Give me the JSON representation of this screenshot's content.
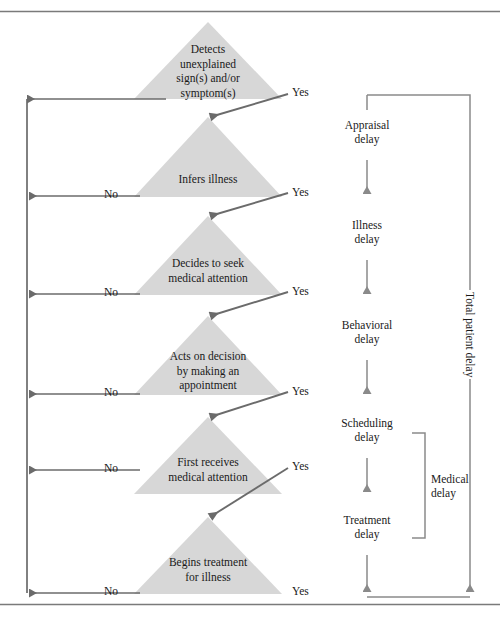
{
  "figure": {
    "colors": {
      "triangle_fill": "#d7d7d7",
      "arrow": "#6b6b6b",
      "rule": "#7a7a7a",
      "text": "#1a1a1a"
    },
    "rules": {
      "top": "horizontal-rule-top",
      "bottom": "horizontal-rule-bottom"
    }
  },
  "stages": [
    {
      "id": "detects",
      "label": "Detects\nunexplained\nsign(s) and/or\nsymptom(s)",
      "yes_label": "Yes",
      "no_label": ""
    },
    {
      "id": "infers",
      "label": "Infers illness",
      "yes_label": "Yes",
      "no_label": "No"
    },
    {
      "id": "decides",
      "label": "Decides to seek\nmedical attention",
      "yes_label": "Yes",
      "no_label": "No"
    },
    {
      "id": "acts",
      "label": "Acts on decision\nby making an\nappointment",
      "yes_label": "Yes",
      "no_label": "No"
    },
    {
      "id": "first-receives",
      "label": "First receives\nmedical attention",
      "yes_label": "Yes",
      "no_label": "No"
    },
    {
      "id": "begins-treatment",
      "label": "Begins treatment\nfor illness",
      "yes_label": "Yes",
      "no_label": "No"
    }
  ],
  "delays": {
    "stages": [
      {
        "id": "appraisal",
        "label": "Appraisal\ndelay"
      },
      {
        "id": "illness",
        "label": "Illness\ndelay"
      },
      {
        "id": "behavioral",
        "label": "Behavioral\ndelay"
      },
      {
        "id": "scheduling",
        "label": "Scheduling\ndelay"
      },
      {
        "id": "treatment",
        "label": "Treatment\ndelay"
      }
    ],
    "bracket": {
      "id": "medical",
      "label": "Medical\ndelay"
    },
    "total": {
      "id": "total-patient",
      "label": "Total patient delay"
    }
  }
}
